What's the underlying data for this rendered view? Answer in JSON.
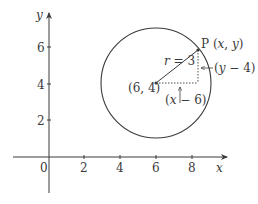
{
  "diagram": {
    "axes": {
      "x_label": "x",
      "y_label": "y",
      "origin_label": "0",
      "x_ticks": [
        "2",
        "4",
        "6",
        "8"
      ],
      "y_ticks": [
        "2",
        "4",
        "6"
      ]
    },
    "circle": {
      "center_label": "(6, 4)",
      "radius_label": "r = 3",
      "point_label": "P (x, y)",
      "vertical_label": "(y − 4)",
      "horizontal_label": "(x − 6)"
    },
    "colors": {
      "line": "#3a3a3a",
      "text": "#3a3a3a"
    }
  }
}
